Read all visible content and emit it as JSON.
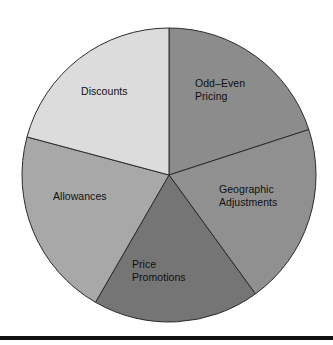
{
  "chart_data": {
    "type": "pie",
    "title": "",
    "subtitle": "",
    "xlabel": "",
    "ylabel": "",
    "legend_position": "none",
    "grid": false,
    "labels_inside_slices": true,
    "start_angle_deg": 0,
    "direction": "clockwise",
    "categories": [
      "Odd–Even Pricing",
      "Geographic Adjustments",
      "Price Promotions",
      "Allowances",
      "Discounts"
    ],
    "values": [
      20,
      20,
      18.3,
      20.8,
      20.8
    ],
    "angles_deg": [
      72,
      72,
      66,
      75,
      75
    ],
    "slices": [
      {
        "label": "Odd–Even Pricing",
        "label_lines": "Odd–Even\nPricing",
        "start_deg": 0,
        "end_deg": 72,
        "sweep_deg": 72,
        "value": 20,
        "color": "#8c8c8c"
      },
      {
        "label": "Geographic Adjustments",
        "label_lines": "Geographic\nAdjustments",
        "start_deg": 72,
        "end_deg": 144,
        "sweep_deg": 72,
        "value": 20,
        "color": "#909090"
      },
      {
        "label": "Price Promotions",
        "label_lines": "Price\nPromotions",
        "start_deg": 144,
        "end_deg": 210,
        "sweep_deg": 66,
        "value": 18.3,
        "color": "#757575"
      },
      {
        "label": "Allowances",
        "label_lines": "Allowances",
        "start_deg": 210,
        "end_deg": 285,
        "sweep_deg": 75,
        "value": 20.8,
        "color": "#a8a8a8"
      },
      {
        "label": "Discounts",
        "label_lines": "Discounts",
        "start_deg": 285,
        "end_deg": 360,
        "sweep_deg": 75,
        "value": 20.8,
        "color": "#dcdcdc"
      }
    ],
    "geometry": {
      "center_x": 169,
      "center_y": 175,
      "radius": 147
    },
    "colors": {
      "outline": "#2b2b2b",
      "background": "#ffffff",
      "label_text": "#101010",
      "rule": "#111111"
    }
  }
}
